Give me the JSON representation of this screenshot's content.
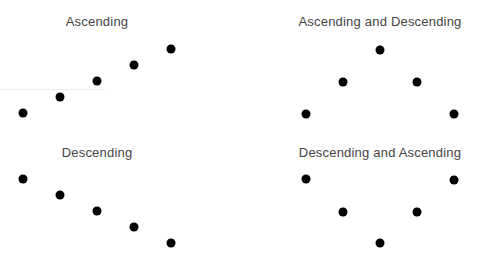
{
  "panels": [
    {
      "title": "Ascending",
      "title_pos": [
        97,
        14
      ],
      "dots": [
        [
          23,
          113
        ],
        [
          60,
          97
        ],
        [
          97,
          81
        ],
        [
          134,
          65
        ],
        [
          171,
          49
        ]
      ]
    },
    {
      "title": "Ascending and Descending",
      "title_pos": [
        380,
        14
      ],
      "dots": [
        [
          306,
          114
        ],
        [
          343,
          82
        ],
        [
          380,
          50
        ],
        [
          417,
          82
        ],
        [
          454,
          114
        ]
      ]
    },
    {
      "title": "Descending",
      "title_pos": [
        97,
        145
      ],
      "dots": [
        [
          23,
          179
        ],
        [
          60,
          195
        ],
        [
          97,
          211
        ],
        [
          134,
          227
        ],
        [
          171,
          243
        ]
      ]
    },
    {
      "title": "Descending and Ascending",
      "title_pos": [
        380,
        145
      ],
      "dots": [
        [
          306,
          179
        ],
        [
          343,
          212
        ],
        [
          380,
          243
        ],
        [
          417,
          212
        ],
        [
          454,
          180
        ]
      ]
    }
  ],
  "dot_color": "#000000",
  "dot_radius": 4.5,
  "chart_data": [
    {
      "type": "scatter",
      "title": "Ascending",
      "x": [
        1,
        2,
        3,
        4,
        5
      ],
      "y": [
        1,
        2,
        3,
        4,
        5
      ]
    },
    {
      "type": "scatter",
      "title": "Ascending and Descending",
      "x": [
        1,
        2,
        3,
        4,
        5
      ],
      "y": [
        1,
        2,
        3,
        2,
        1
      ]
    },
    {
      "type": "scatter",
      "title": "Descending",
      "x": [
        1,
        2,
        3,
        4,
        5
      ],
      "y": [
        5,
        4,
        3,
        2,
        1
      ]
    },
    {
      "type": "scatter",
      "title": "Descending and Ascending",
      "x": [
        1,
        2,
        3,
        4,
        5
      ],
      "y": [
        3,
        2,
        1,
        2,
        3
      ]
    }
  ]
}
